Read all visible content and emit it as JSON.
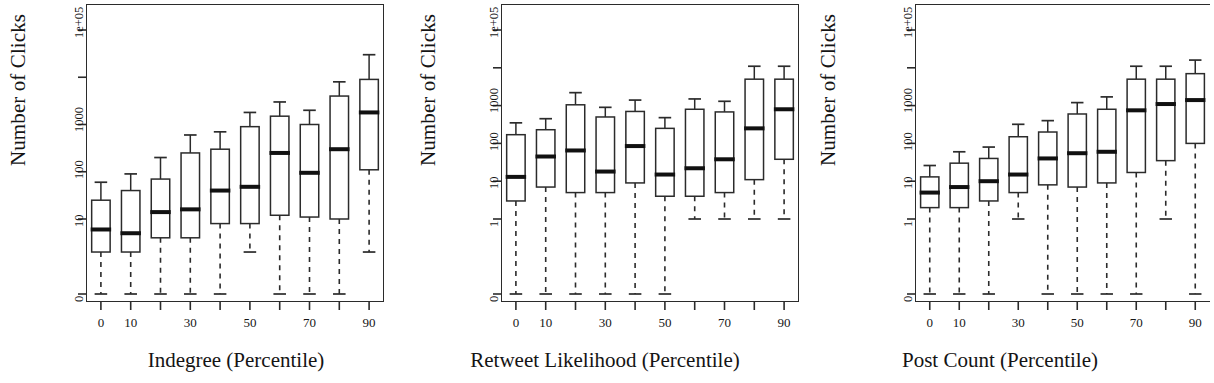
{
  "figure": {
    "type": "boxplot-panel-row",
    "panel_count": 3,
    "shared_ylabel": "Number of Clicks",
    "note": "Three side-by-side R-style boxplot panels; y axis is log-like with a 0 break at the bottom."
  },
  "chart_data": [
    {
      "type": "box",
      "title": "",
      "xlabel": "Indegree (Percentile)",
      "ylabel": "Number of Clicks",
      "yticklabels": [
        "0",
        "10",
        "100",
        "1000",
        "",
        "1e+05"
      ],
      "ytickvalues": [
        0,
        10,
        100,
        1000,
        10000,
        100000
      ],
      "xticklabels": [
        "0",
        "10",
        "",
        "30",
        "",
        "50",
        "",
        "70",
        "",
        "90"
      ],
      "categories": [
        0,
        10,
        20,
        30,
        40,
        50,
        60,
        70,
        80,
        90
      ],
      "grid": false,
      "legend": null,
      "boxes": [
        {
          "category": 0,
          "lower_whisker": 0,
          "q1": 2,
          "median": 6,
          "q3": 25,
          "upper_whisker": 60
        },
        {
          "category": 10,
          "lower_whisker": 0,
          "q1": 2,
          "median": 5,
          "q3": 40,
          "upper_whisker": 90
        },
        {
          "category": 20,
          "lower_whisker": 0,
          "q1": 4,
          "median": 14,
          "q3": 70,
          "upper_whisker": 200
        },
        {
          "category": 30,
          "lower_whisker": 0,
          "q1": 4,
          "median": 16,
          "q3": 250,
          "upper_whisker": 600
        },
        {
          "category": 40,
          "lower_whisker": 0,
          "q1": 8,
          "median": 40,
          "q3": 300,
          "upper_whisker": 700
        },
        {
          "category": 50,
          "lower_whisker": 2,
          "q1": 8,
          "median": 48,
          "q3": 900,
          "upper_whisker": 1800
        },
        {
          "category": 60,
          "lower_whisker": 0,
          "q1": 12,
          "median": 250,
          "q3": 1500,
          "upper_whisker": 3000
        },
        {
          "category": 70,
          "lower_whisker": 0,
          "q1": 11,
          "median": 95,
          "q3": 1000,
          "upper_whisker": 2000
        },
        {
          "category": 80,
          "lower_whisker": 0,
          "q1": 10,
          "median": 300,
          "q3": 4000,
          "upper_whisker": 8000
        },
        {
          "category": 90,
          "lower_whisker": 2,
          "q1": 110,
          "median": 1800,
          "q3": 9000,
          "upper_whisker": 30000
        }
      ]
    },
    {
      "type": "box",
      "title": "",
      "xlabel": "Retweet Likelihood (Percentile)",
      "ylabel": "Number of Clicks",
      "yticklabels": [
        "0",
        "1",
        "10",
        "100",
        "1000",
        "",
        "1e+05"
      ],
      "ytickvalues": [
        0,
        1,
        10,
        100,
        1000,
        10000,
        100000
      ],
      "xticklabels": [
        "0",
        "10",
        "",
        "30",
        "",
        "50",
        "",
        "70",
        "",
        "90"
      ],
      "categories": [
        0,
        10,
        20,
        30,
        40,
        50,
        60,
        70,
        80,
        90
      ],
      "grid": false,
      "legend": null,
      "boxes": [
        {
          "category": 0,
          "lower_whisker": 0,
          "q1": 3,
          "median": 13,
          "q3": 170,
          "upper_whisker": 350
        },
        {
          "category": 10,
          "lower_whisker": 0,
          "q1": 7,
          "median": 45,
          "q3": 230,
          "upper_whisker": 450
        },
        {
          "category": 20,
          "lower_whisker": 0,
          "q1": 5,
          "median": 65,
          "q3": 1050,
          "upper_whisker": 2200
        },
        {
          "category": 30,
          "lower_whisker": 0,
          "q1": 5,
          "median": 18,
          "q3": 500,
          "upper_whisker": 900
        },
        {
          "category": 40,
          "lower_whisker": 0,
          "q1": 9,
          "median": 85,
          "q3": 700,
          "upper_whisker": 1400
        },
        {
          "category": 50,
          "lower_whisker": 0,
          "q1": 4,
          "median": 15,
          "q3": 250,
          "upper_whisker": 480
        },
        {
          "category": 60,
          "lower_whisker": 1,
          "q1": 4,
          "median": 22,
          "q3": 800,
          "upper_whisker": 1500
        },
        {
          "category": 70,
          "lower_whisker": 1,
          "q1": 5,
          "median": 38,
          "q3": 680,
          "upper_whisker": 1300
        },
        {
          "category": 80,
          "lower_whisker": 1,
          "q1": 11,
          "median": 250,
          "q3": 5000,
          "upper_whisker": 11000
        },
        {
          "category": 90,
          "lower_whisker": 1,
          "q1": 38,
          "median": 800,
          "q3": 5000,
          "upper_whisker": 11000
        }
      ]
    },
    {
      "type": "box",
      "title": "",
      "xlabel": "Post Count (Percentile)",
      "ylabel": "Number of Clicks",
      "yticklabels": [
        "0",
        "1",
        "10",
        "100",
        "1000",
        "",
        "1e+05"
      ],
      "ytickvalues": [
        0,
        1,
        10,
        100,
        1000,
        10000,
        100000
      ],
      "xticklabels": [
        "0",
        "10",
        "",
        "30",
        "",
        "50",
        "",
        "70",
        "",
        "90"
      ],
      "categories": [
        0,
        10,
        20,
        30,
        40,
        50,
        60,
        70,
        80,
        90
      ],
      "grid": false,
      "legend": null,
      "boxes": [
        {
          "category": 0,
          "lower_whisker": 0,
          "q1": 2,
          "median": 5,
          "q3": 13,
          "upper_whisker": 26
        },
        {
          "category": 10,
          "lower_whisker": 0,
          "q1": 2,
          "median": 7,
          "q3": 30,
          "upper_whisker": 60
        },
        {
          "category": 20,
          "lower_whisker": 0,
          "q1": 3,
          "median": 10,
          "q3": 40,
          "upper_whisker": 80
        },
        {
          "category": 30,
          "lower_whisker": 1,
          "q1": 5,
          "median": 15,
          "q3": 150,
          "upper_whisker": 320
        },
        {
          "category": 40,
          "lower_whisker": 0,
          "q1": 8,
          "median": 40,
          "q3": 200,
          "upper_whisker": 400
        },
        {
          "category": 50,
          "lower_whisker": 0,
          "q1": 7,
          "median": 55,
          "q3": 600,
          "upper_whisker": 1200
        },
        {
          "category": 60,
          "lower_whisker": 0,
          "q1": 9,
          "median": 60,
          "q3": 800,
          "upper_whisker": 1700
        },
        {
          "category": 70,
          "lower_whisker": 0,
          "q1": 17,
          "median": 750,
          "q3": 5000,
          "upper_whisker": 11000
        },
        {
          "category": 80,
          "lower_whisker": 1,
          "q1": 35,
          "median": 1100,
          "q3": 5000,
          "upper_whisker": 11000
        },
        {
          "category": 90,
          "lower_whisker": 0,
          "q1": 100,
          "median": 1400,
          "q3": 7000,
          "upper_whisker": 16000
        }
      ]
    }
  ]
}
